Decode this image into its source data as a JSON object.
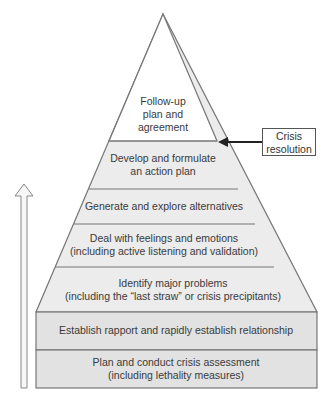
{
  "diagram": {
    "type": "pyramid",
    "layers_top_to_bottom": [
      {
        "line1": "Follow-up",
        "line2": "plan and",
        "line3": "agreement"
      },
      {
        "line1": "Develop and formulate",
        "line2": "an action plan"
      },
      {
        "line1": "Generate and explore alternatives"
      },
      {
        "line1": "Deal with feelings and emotions",
        "line2": "(including active listening and validation)"
      },
      {
        "line1": "Identify major problems",
        "line2": "(including the “last straw” or crisis precipitants)"
      },
      {
        "line1": "Establish rapport and rapidly establish relationship"
      },
      {
        "line1": "Plan and conduct crisis assessment",
        "line2": "(including lethality measures)"
      }
    ],
    "callout": {
      "line1": "Crisis",
      "line2": "resolution",
      "points_to": "boundary between Follow-up and Develop layers"
    },
    "side_arrow": {
      "direction": "up",
      "icon": "hollow-up-arrow-icon"
    },
    "colors": {
      "fill": "#ececec",
      "stroke": "#777777",
      "text": "#3a3a3a"
    }
  }
}
